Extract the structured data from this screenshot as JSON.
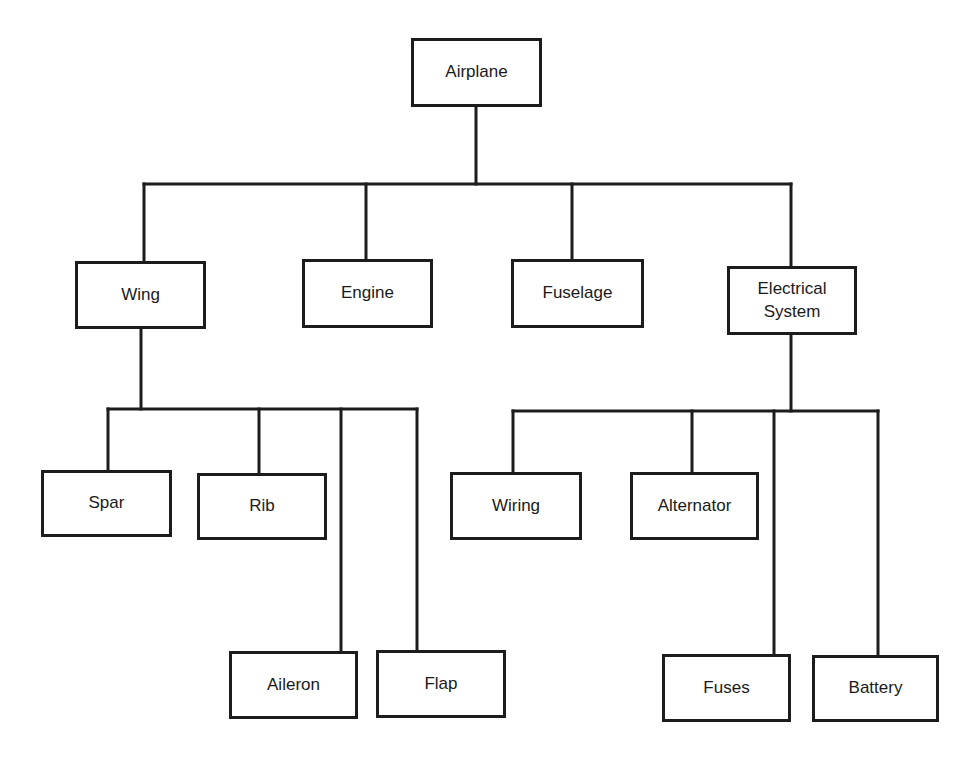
{
  "diagram": {
    "type": "hierarchy-tree",
    "root": "Airplane",
    "nodes": {
      "airplane": "Airplane",
      "wing": "Wing",
      "engine": "Engine",
      "fuselage": "Fuselage",
      "electrical_system": "Electrical\nSystem",
      "spar": "Spar",
      "rib": "Rib",
      "aileron": "Aileron",
      "flap": "Flap",
      "wiring": "Wiring",
      "alternator": "Alternator",
      "fuses": "Fuses",
      "battery": "Battery"
    },
    "edges": [
      [
        "Airplane",
        "Wing"
      ],
      [
        "Airplane",
        "Engine"
      ],
      [
        "Airplane",
        "Fuselage"
      ],
      [
        "Airplane",
        "Electrical System"
      ],
      [
        "Wing",
        "Spar"
      ],
      [
        "Wing",
        "Rib"
      ],
      [
        "Wing",
        "Aileron"
      ],
      [
        "Wing",
        "Flap"
      ],
      [
        "Electrical System",
        "Wiring"
      ],
      [
        "Electrical System",
        "Alternator"
      ],
      [
        "Electrical System",
        "Fuses"
      ],
      [
        "Electrical System",
        "Battery"
      ]
    ]
  }
}
